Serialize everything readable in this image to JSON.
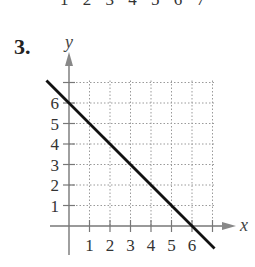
{
  "problem": {
    "number": "3.",
    "top_fragment": "1 2 3 4 5 6 7"
  },
  "chart_data": {
    "type": "line",
    "title": "",
    "xlabel": "x",
    "ylabel": "y",
    "x_ticks": [
      "1",
      "2",
      "3",
      "4",
      "5",
      "6"
    ],
    "y_ticks": [
      "1",
      "2",
      "3",
      "4",
      "5",
      "6"
    ],
    "xlim": [
      -1,
      8
    ],
    "ylim": [
      -1.5,
      8
    ],
    "grid": true,
    "grid_style": "dotted",
    "series": [
      {
        "name": "line",
        "equation": "y = -x + 6",
        "x": [
          -1.1,
          7.1
        ],
        "y": [
          7.1,
          -1.1
        ],
        "color": "#111111"
      }
    ],
    "intercepts": {
      "x": 6,
      "y": 6
    }
  }
}
